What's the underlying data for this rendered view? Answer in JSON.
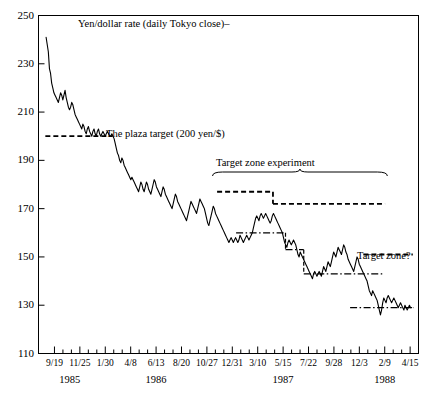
{
  "chart_data": {
    "type": "line",
    "title": "Yen/dollar rate (daily Tokyo close)–",
    "xlabel": "",
    "ylabel": "",
    "ylim": [
      110,
      250
    ],
    "xlim": [
      "9/19/1985",
      "4/15/1988"
    ],
    "grid": false,
    "legend": "none",
    "yticks": [
      250,
      230,
      210,
      190,
      170,
      150,
      130,
      110
    ],
    "xticks": [
      "9/19",
      "11/25",
      "1/30",
      "4/8",
      "6/13",
      "8/20",
      "10/27",
      "12/31",
      "3/10",
      "5/15",
      "7/22",
      "9/28",
      "12/3",
      "2/9",
      "4/15"
    ],
    "xtick_years": [
      {
        "label": "1985",
        "at": "10/22"
      },
      {
        "label": "1986",
        "at": "6/13"
      },
      {
        "label": "1987",
        "at": "5/15"
      },
      {
        "label": "1988",
        "at": "2/9"
      }
    ],
    "annotations": [
      {
        "name": "plaza-target",
        "text": "The plaza target (200 yen/$)",
        "level": 200,
        "line_from": "9/19/1985",
        "line_to": "1/15/1986",
        "style": "dashed"
      },
      {
        "name": "target-zone-experiment",
        "text": "Target zone experiment",
        "brace_from": "10/27/1986",
        "brace_to": "10/20/1987"
      },
      {
        "name": "target-zone-experiment-band-1",
        "level": 177,
        "line_from": "10/27/1986",
        "line_to": "1/28/1987",
        "style": "dashed"
      },
      {
        "name": "target-zone-experiment-band-2",
        "level": 172,
        "line_from": "1/28/1987",
        "line_to": "10/20/1987",
        "style": "dashed"
      },
      {
        "name": "target-zone-question",
        "text": "Target zone?",
        "level": 151,
        "line_from": "1/20/1988",
        "line_to": "4/10/1988",
        "style": "dashed"
      },
      {
        "name": "reference-band-160",
        "level": 160,
        "line_from": "11/20/1986",
        "line_to": "2/20/1987",
        "style": "dash-dot"
      },
      {
        "name": "reference-band-153",
        "level": 153,
        "line_from": "2/20/1987",
        "line_to": "3/25/1987",
        "style": "dash-dot"
      },
      {
        "name": "reference-band-143",
        "level": 143,
        "line_from": "4/20/1987",
        "line_to": "10/10/1987",
        "style": "dash-dot"
      },
      {
        "name": "reference-band-129",
        "level": 129,
        "line_from": "12/15/1987",
        "line_to": "4/15/1988",
        "style": "dash-dot"
      }
    ],
    "series": [
      {
        "name": "Yen/dollar rate (daily Tokyo close)",
        "units": "yen per US dollar",
        "start": "9/19/1985",
        "end": "4/15/1988",
        "values": [
          241,
          238,
          235,
          228,
          226,
          222,
          220,
          218,
          217,
          216,
          215,
          214,
          216,
          218,
          217,
          215,
          217,
          219,
          216,
          214,
          212,
          211,
          212,
          214,
          213,
          211,
          209,
          208,
          207,
          206,
          205,
          204,
          203,
          205,
          204,
          202,
          201,
          203,
          204,
          202,
          201,
          200,
          202,
          203,
          201,
          200,
          202,
          203,
          201,
          200,
          201,
          202,
          201,
          200,
          201,
          202,
          201,
          200,
          200,
          201,
          200,
          199,
          197,
          195,
          193,
          192,
          190,
          189,
          191,
          190,
          188,
          187,
          186,
          185,
          184,
          183,
          182,
          183,
          182,
          181,
          180,
          179,
          178,
          177,
          179,
          181,
          180,
          178,
          177,
          179,
          181,
          180,
          178,
          177,
          176,
          178,
          180,
          182,
          181,
          179,
          178,
          177,
          176,
          175,
          177,
          179,
          178,
          176,
          175,
          174,
          173,
          172,
          171,
          170,
          172,
          174,
          176,
          175,
          173,
          172,
          171,
          170,
          169,
          168,
          167,
          166,
          165,
          167,
          169,
          171,
          173,
          172,
          171,
          170,
          169,
          168,
          170,
          172,
          174,
          173,
          172,
          171,
          170,
          168,
          166,
          164,
          163,
          165,
          167,
          169,
          171,
          170,
          168,
          167,
          166,
          165,
          164,
          163,
          162,
          161,
          160,
          159,
          158,
          157,
          156,
          157,
          158,
          157,
          156,
          157,
          158,
          157,
          156,
          157,
          159,
          158,
          157,
          156,
          157,
          158,
          159,
          158,
          157,
          158,
          159,
          160,
          162,
          164,
          166,
          167,
          166,
          165,
          167,
          168,
          167,
          166,
          167,
          168,
          167,
          166,
          165,
          164,
          165,
          167,
          168,
          167,
          166,
          165,
          164,
          163,
          162,
          161,
          160,
          158,
          156,
          155,
          154,
          156,
          157,
          156,
          155,
          156,
          157,
          156,
          155,
          153,
          151,
          150,
          152,
          151,
          150,
          149,
          148,
          147,
          146,
          145,
          144,
          143,
          142,
          141,
          143,
          144,
          143,
          142,
          143,
          144,
          143,
          142,
          144,
          146,
          145,
          144,
          146,
          148,
          147,
          146,
          148,
          150,
          152,
          151,
          150,
          152,
          154,
          153,
          152,
          151,
          153,
          155,
          154,
          152,
          151,
          149,
          148,
          147,
          146,
          145,
          144,
          146,
          148,
          150,
          149,
          147,
          146,
          145,
          144,
          143,
          142,
          141,
          140,
          138,
          136,
          135,
          134,
          136,
          135,
          134,
          133,
          132,
          130,
          128,
          126,
          128,
          131,
          133,
          132,
          131,
          133,
          134,
          133,
          132,
          131,
          132,
          133,
          132,
          131,
          130,
          129,
          130,
          131,
          130,
          129,
          128,
          130,
          129,
          128,
          129,
          130,
          129,
          129
        ]
      }
    ]
  }
}
